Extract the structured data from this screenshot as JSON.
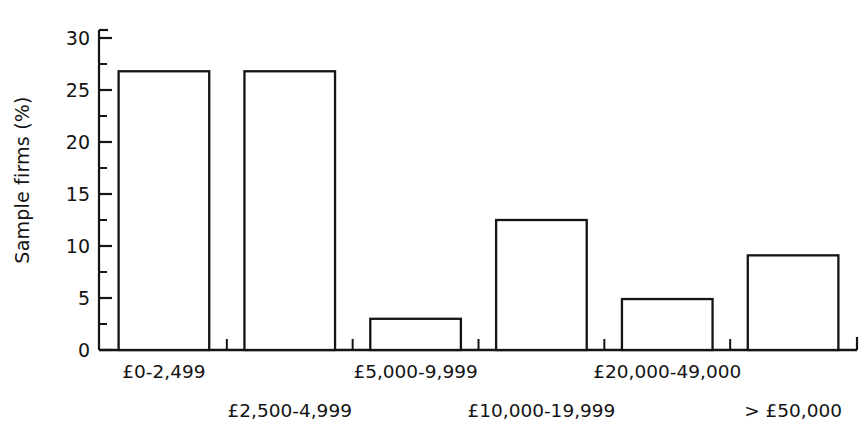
{
  "chart_data": {
    "type": "bar",
    "title": "",
    "subtitle": "",
    "xlabel": "",
    "ylabel": "Sample firms (%)",
    "categories": [
      "£0-2,499",
      "£2,500-4,999",
      "£5,000-9,999",
      "£10,000-19,999",
      "£20,000-49,000",
      "> £50,000"
    ],
    "values": [
      26.8,
      26.8,
      3.0,
      12.5,
      4.9,
      9.1
    ],
    "ylim": [
      0,
      30
    ],
    "ytick_labels": [
      "0",
      "5",
      "10",
      "15",
      "20",
      "25",
      "30"
    ],
    "ytick_values": [
      0,
      5,
      10,
      15,
      20,
      25,
      30
    ],
    "yminor_values": [
      2.5,
      7.5,
      12.5,
      17.5,
      22.5,
      27.5
    ],
    "grid": false,
    "legend": false,
    "legend_position": "none",
    "bar_fill": "#ffffff",
    "bar_edge": "#141414",
    "axis_color": "#141414",
    "background": "#ffffff"
  },
  "axis": {
    "y_title": "Sample firms (%)"
  }
}
